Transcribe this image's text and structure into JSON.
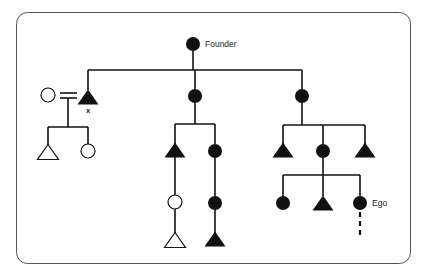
{
  "diagram": {
    "type": "genealogy-kinship-chart",
    "frame": {
      "shape": "rounded-rectangle",
      "x": 16,
      "y": 12,
      "width": 394,
      "height": 251,
      "corner_radius": 11,
      "stroke_color": "#555555",
      "stroke_width": 1,
      "fill_color": "#ffffff"
    },
    "style": {
      "line_color": "#111111",
      "line_width": 1.6,
      "filled_color": "#111111",
      "open_fill": "#ffffff",
      "open_stroke": "#111111",
      "circle_radius": 7,
      "triangle_width": 21,
      "triangle_height": 15
    },
    "labels": {
      "founder": "Founder",
      "ego": "Ego",
      "marriage_x": "x"
    },
    "symbol_legend": {
      "filled_circle": "lineage female",
      "filled_triangle": "lineage male",
      "open_circle": "non-lineage female",
      "open_triangle": "non-lineage male",
      "equals_sign": "marriage",
      "dashed_line": "descent continues"
    },
    "nodes": [
      {
        "id": "founder",
        "shape": "circle",
        "fill": "filled",
        "x": 193,
        "y": 44,
        "label": "Founder",
        "label_pos": "right"
      },
      {
        "id": "g1-son",
        "shape": "triangle",
        "fill": "filled",
        "x": 88,
        "y": 97,
        "label": "x",
        "label_pos": "below"
      },
      {
        "id": "g1-spouse",
        "shape": "circle",
        "fill": "open",
        "x": 48,
        "y": 95,
        "label": "",
        "label_pos": ""
      },
      {
        "id": "g1-dau-m",
        "shape": "circle",
        "fill": "filled",
        "x": 195,
        "y": 96,
        "label": "",
        "label_pos": ""
      },
      {
        "id": "g1-dau-r",
        "shape": "circle",
        "fill": "filled",
        "x": 302,
        "y": 96,
        "label": "",
        "label_pos": ""
      },
      {
        "id": "g2-l-tri",
        "shape": "triangle",
        "fill": "open",
        "x": 48,
        "y": 152,
        "label": "",
        "label_pos": ""
      },
      {
        "id": "g2-l-cir",
        "shape": "circle",
        "fill": "open",
        "x": 88,
        "y": 151,
        "label": "",
        "label_pos": ""
      },
      {
        "id": "g2-m-tri",
        "shape": "triangle",
        "fill": "filled",
        "x": 175,
        "y": 150,
        "label": "",
        "label_pos": ""
      },
      {
        "id": "g2-m-cir",
        "shape": "circle",
        "fill": "filled",
        "x": 215,
        "y": 151,
        "label": "",
        "label_pos": ""
      },
      {
        "id": "g2-r-tri1",
        "shape": "triangle",
        "fill": "filled",
        "x": 283,
        "y": 150,
        "label": "",
        "label_pos": ""
      },
      {
        "id": "g2-r-cir",
        "shape": "circle",
        "fill": "filled",
        "x": 323,
        "y": 151,
        "label": "",
        "label_pos": ""
      },
      {
        "id": "g2-r-tri2",
        "shape": "triangle",
        "fill": "filled",
        "x": 365,
        "y": 150,
        "label": "",
        "label_pos": ""
      },
      {
        "id": "g3-m-cir",
        "shape": "circle",
        "fill": "open",
        "x": 175,
        "y": 202,
        "label": "",
        "label_pos": ""
      },
      {
        "id": "g3-m-cir2",
        "shape": "circle",
        "fill": "filled",
        "x": 215,
        "y": 203,
        "label": "",
        "label_pos": ""
      },
      {
        "id": "g3-r-cir",
        "shape": "circle",
        "fill": "filled",
        "x": 283,
        "y": 203,
        "label": "",
        "label_pos": ""
      },
      {
        "id": "g3-r-tri",
        "shape": "triangle",
        "fill": "filled",
        "x": 323,
        "y": 203,
        "label": "",
        "label_pos": ""
      },
      {
        "id": "ego",
        "shape": "circle",
        "fill": "filled",
        "x": 360,
        "y": 203,
        "label": "Ego",
        "label_pos": "right"
      },
      {
        "id": "g4-m-tri",
        "shape": "triangle",
        "fill": "open",
        "x": 175,
        "y": 240,
        "label": "",
        "label_pos": ""
      },
      {
        "id": "g4-m-tri2",
        "shape": "triangle",
        "fill": "filled",
        "x": 215,
        "y": 239,
        "label": "",
        "label_pos": ""
      }
    ],
    "connectors": [
      {
        "id": "founder-stem",
        "type": "vline",
        "x": 193,
        "y1": 51,
        "y2": 70
      },
      {
        "id": "gen1-sibling-bar",
        "type": "hline",
        "y": 70,
        "x1": 88,
        "x2": 302
      },
      {
        "id": "drop-g1-son",
        "type": "vline",
        "x": 88,
        "y1": 70,
        "y2": 90
      },
      {
        "id": "drop-g1-dau-m",
        "type": "vline",
        "x": 195,
        "y1": 70,
        "y2": 89
      },
      {
        "id": "drop-g1-dau-r",
        "type": "vline",
        "x": 302,
        "y1": 70,
        "y2": 89
      },
      {
        "id": "marriage-eq-top",
        "type": "hline",
        "y": 93,
        "x1": 60,
        "x2": 77
      },
      {
        "id": "marriage-eq-bot",
        "type": "hline",
        "y": 98,
        "x1": 60,
        "x2": 77
      },
      {
        "id": "marriage-descent",
        "type": "vline",
        "x": 68,
        "y1": 98,
        "y2": 127
      },
      {
        "id": "left-sibling-bar",
        "type": "hline",
        "y": 127,
        "x1": 48,
        "x2": 88
      },
      {
        "id": "drop-g2-l-tri",
        "type": "vline",
        "x": 48,
        "y1": 127,
        "y2": 146
      },
      {
        "id": "drop-g2-l-cir",
        "type": "vline",
        "x": 88,
        "y1": 127,
        "y2": 144
      },
      {
        "id": "mid-stem",
        "type": "vline",
        "x": 195,
        "y1": 103,
        "y2": 124
      },
      {
        "id": "mid-sibling-bar",
        "type": "hline",
        "y": 124,
        "x1": 175,
        "x2": 215
      },
      {
        "id": "drop-g2-m-tri",
        "type": "vline",
        "x": 175,
        "y1": 124,
        "y2": 144
      },
      {
        "id": "drop-g2-m-cir",
        "type": "vline",
        "x": 215,
        "y1": 124,
        "y2": 144
      },
      {
        "id": "mid-l-descent",
        "type": "vline",
        "x": 175,
        "y1": 150,
        "y2": 195
      },
      {
        "id": "mid-l-descent2",
        "type": "vline",
        "x": 175,
        "y1": 209,
        "y2": 233
      },
      {
        "id": "mid-r-descent",
        "type": "vline",
        "x": 215,
        "y1": 158,
        "y2": 196
      },
      {
        "id": "mid-r-descent2",
        "type": "vline",
        "x": 215,
        "y1": 210,
        "y2": 233
      },
      {
        "id": "right-stem",
        "type": "vline",
        "x": 302,
        "y1": 103,
        "y2": 125
      },
      {
        "id": "right-sibling-bar",
        "type": "hline",
        "y": 125,
        "x1": 283,
        "x2": 365
      },
      {
        "id": "drop-g2-r-tri1",
        "type": "vline",
        "x": 283,
        "y1": 125,
        "y2": 144
      },
      {
        "id": "drop-g2-r-cir",
        "type": "vline",
        "x": 323,
        "y1": 125,
        "y2": 144
      },
      {
        "id": "drop-g2-r-tri2",
        "type": "vline",
        "x": 365,
        "y1": 125,
        "y2": 144
      },
      {
        "id": "right-g2-stem",
        "type": "vline",
        "x": 323,
        "y1": 158,
        "y2": 175
      },
      {
        "id": "right-g3-bar",
        "type": "hline",
        "y": 175,
        "x1": 283,
        "x2": 360
      },
      {
        "id": "drop-g3-r-cir",
        "type": "vline",
        "x": 283,
        "y1": 175,
        "y2": 196
      },
      {
        "id": "drop-g3-r-tri",
        "type": "vline",
        "x": 323,
        "y1": 175,
        "y2": 196
      },
      {
        "id": "drop-ego",
        "type": "vline",
        "x": 360,
        "y1": 175,
        "y2": 196
      },
      {
        "id": "ego-dashed",
        "type": "dashed",
        "x": 360,
        "y1": 212,
        "y2": 236
      }
    ]
  }
}
